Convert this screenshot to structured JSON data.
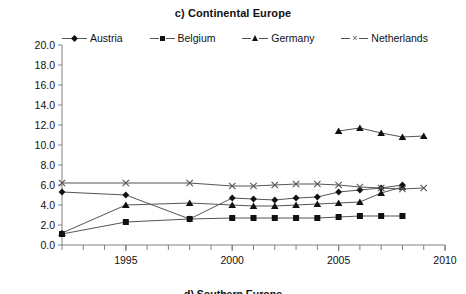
{
  "chart_data": {
    "type": "line",
    "title": "c) Continental Europe",
    "xlabel": "",
    "ylabel": "",
    "xlim": [
      1992,
      2010
    ],
    "ylim": [
      0.0,
      20.0
    ],
    "grid": false,
    "legend_position": "top",
    "xticks": [
      1995,
      2000,
      2005,
      2010
    ],
    "xtick_labels": [
      "1995",
      "2000",
      "2005",
      "2010"
    ],
    "yticks": [
      0.0,
      2.0,
      4.0,
      6.0,
      8.0,
      10.0,
      12.0,
      14.0,
      16.0,
      18.0,
      20.0
    ],
    "ytick_labels": [
      "0.0",
      "2.0",
      "4.0",
      "6.0",
      "8.0",
      "10.0",
      "12.0",
      "14.0",
      "16.0",
      "18.0",
      "20.0"
    ],
    "series": [
      {
        "name": "Austria",
        "marker": "diamond",
        "x": [
          1992,
          1995,
          1998,
          2000,
          2001,
          2002,
          2003,
          2004,
          2005,
          2006,
          2007,
          2008
        ],
        "values": [
          5.3,
          5.0,
          2.6,
          4.7,
          4.6,
          4.5,
          4.7,
          4.8,
          5.3,
          5.5,
          5.7,
          6.0
        ]
      },
      {
        "name": "Belgium",
        "marker": "square",
        "x": [
          1992,
          1995,
          1998,
          2000,
          2001,
          2002,
          2003,
          2004,
          2005,
          2006,
          2007,
          2008
        ],
        "values": [
          1.1,
          2.3,
          2.6,
          2.7,
          2.7,
          2.7,
          2.7,
          2.7,
          2.8,
          2.9,
          2.9,
          2.9
        ]
      },
      {
        "name": "Germany",
        "marker": "triangle",
        "x": [
          1992,
          1995,
          1998,
          2000,
          2001,
          2002,
          2003,
          2004,
          2005,
          2006,
          2007,
          2008
        ],
        "values": [
          1.2,
          4.0,
          4.2,
          4.0,
          3.9,
          3.9,
          4.0,
          4.1,
          4.2,
          4.3,
          5.2,
          5.8
        ]
      },
      {
        "name": "Germany (upper)",
        "marker": "triangle",
        "x": [
          2005,
          2006,
          2007,
          2008,
          2009
        ],
        "values": [
          11.4,
          11.7,
          11.2,
          10.8,
          10.9
        ]
      },
      {
        "name": "Netherlands",
        "marker": "cross",
        "x": [
          1992,
          1995,
          1998,
          2000,
          2001,
          2002,
          2003,
          2004,
          2005,
          2006,
          2007,
          2008,
          2009
        ],
        "values": [
          6.2,
          6.2,
          6.2,
          5.9,
          5.9,
          6.0,
          6.1,
          6.1,
          6.0,
          5.8,
          5.7,
          5.6,
          5.7
        ]
      }
    ]
  },
  "legend": {
    "items": [
      {
        "label": "Austria",
        "marker": "diamond"
      },
      {
        "label": "Belgium",
        "marker": "square"
      },
      {
        "label": "Germany",
        "marker": "triangle"
      },
      {
        "label": "Netherlands",
        "marker": "cross"
      }
    ]
  },
  "bottom_caption": "d) Southern Europe",
  "colors": {
    "line": "#555555",
    "marker": "#111111",
    "axis": "#808080",
    "text": "#111111",
    "background": "#ffffff"
  }
}
